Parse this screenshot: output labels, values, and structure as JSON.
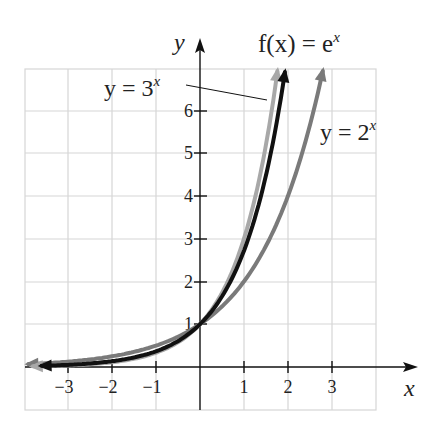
{
  "chart_data": {
    "type": "line",
    "title": "",
    "xlabel": "x",
    "ylabel": "y",
    "xlim": [
      -4,
      4
    ],
    "ylim": [
      -1,
      7
    ],
    "grid": true,
    "x_ticks": [
      "-3",
      "-2",
      "-1",
      "1",
      "2",
      "3"
    ],
    "y_ticks": [
      "1",
      "2",
      "3",
      "4",
      "5",
      "6"
    ],
    "series": [
      {
        "name": "y = 3^x",
        "label_main": "y = 3",
        "label_exp": "x",
        "base": 3,
        "color": "#a8a8a8",
        "points": [
          [
            -3.8,
            0.015
          ],
          [
            -3,
            0.037
          ],
          [
            -2,
            0.111
          ],
          [
            -1,
            0.333
          ],
          [
            0,
            1
          ],
          [
            1,
            3
          ],
          [
            1.5,
            5.196
          ],
          [
            1.76,
            6.9
          ]
        ]
      },
      {
        "name": "f(x) = e^x",
        "label_main": "f(x) = e",
        "label_exp": "x",
        "base": 2.71828,
        "color": "#111111",
        "points": [
          [
            -3.6,
            0.027
          ],
          [
            -3,
            0.05
          ],
          [
            -2,
            0.135
          ],
          [
            -1,
            0.368
          ],
          [
            0,
            1
          ],
          [
            1,
            2.718
          ],
          [
            1.5,
            4.48
          ],
          [
            1.93,
            6.9
          ]
        ]
      },
      {
        "name": "y = 2^x",
        "label_main": "y = 2",
        "label_exp": "x",
        "base": 2,
        "color": "#7a7a7a",
        "points": [
          [
            -3.9,
            0.067
          ],
          [
            -3,
            0.125
          ],
          [
            -2,
            0.25
          ],
          [
            -1,
            0.5
          ],
          [
            0,
            1
          ],
          [
            1,
            2
          ],
          [
            2,
            4
          ],
          [
            2.79,
            6.9
          ]
        ]
      }
    ],
    "annotations": [
      {
        "text": "y = 3^x",
        "leader_line": true
      },
      {
        "text": "f(x) = e^x"
      },
      {
        "text": "y = 2^x"
      }
    ],
    "legend": "inline labels"
  },
  "axis": {
    "x_label": "x",
    "y_label": "y"
  },
  "labels": {
    "three": {
      "main": "y = 3",
      "exp": "x"
    },
    "e": {
      "main": "f(x) = e",
      "exp": "x"
    },
    "two": {
      "main": "y = 2",
      "exp": "x"
    }
  },
  "ticks": {
    "x": [
      "−3",
      "−2",
      "−1",
      "1",
      "2",
      "3"
    ],
    "y": [
      "1",
      "2",
      "3",
      "4",
      "5",
      "6"
    ]
  }
}
